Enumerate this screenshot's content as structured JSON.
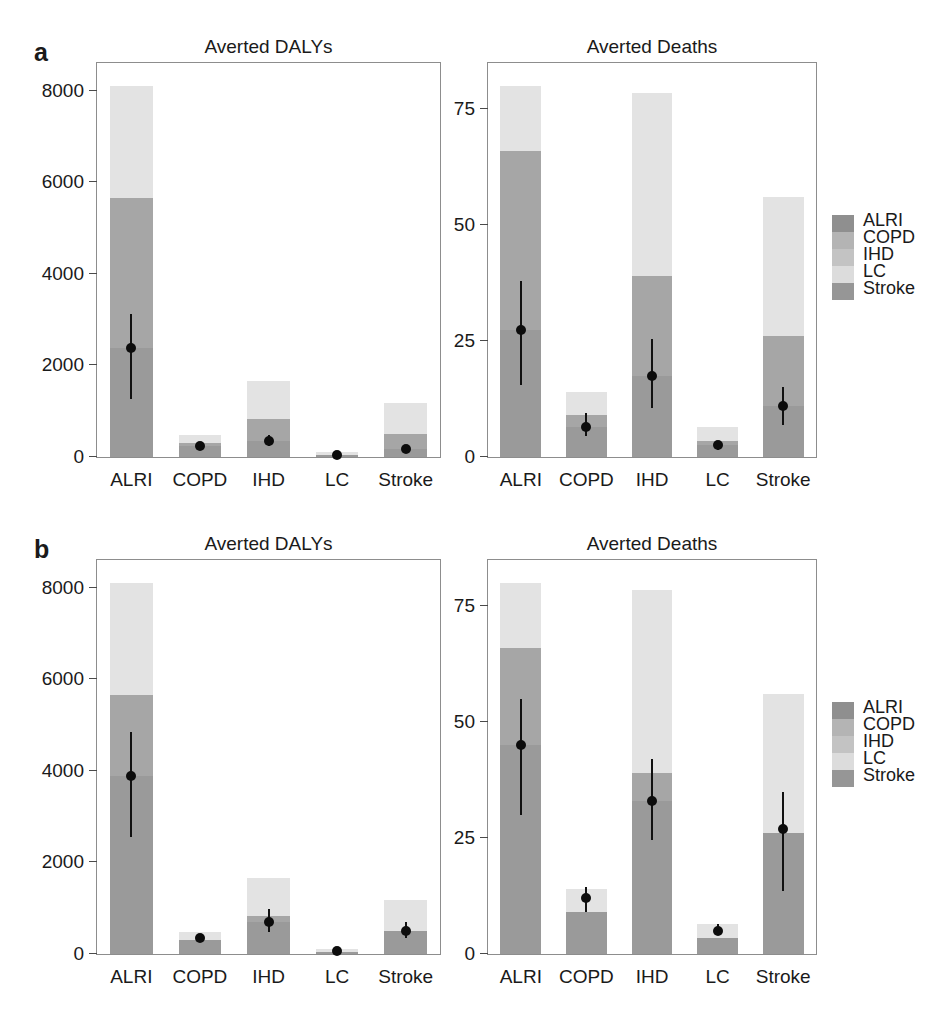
{
  "figure": {
    "panels": [
      {
        "letter": "a"
      },
      {
        "letter": "b"
      }
    ]
  },
  "legend": {
    "title": "",
    "items": [
      {
        "label": "ALRI",
        "color": "#8f8f8f"
      },
      {
        "label": "COPD",
        "color": "#b4b4b4"
      },
      {
        "label": "IHD",
        "color": "#c3c3c3"
      },
      {
        "label": "LC",
        "color": "#dcdcdc"
      },
      {
        "label": "Stroke",
        "color": "#969696"
      }
    ]
  },
  "chart_data": [
    {
      "type": "bar",
      "panel": "a",
      "title": "Averted DALYs",
      "xlabel": "",
      "ylabel": "",
      "ylim": [
        0,
        8600
      ],
      "yticks": [
        0,
        2000,
        4000,
        6000,
        8000
      ],
      "ytick_labels": [
        "0",
        "2000",
        "4000",
        "6000",
        "8000"
      ],
      "grid": false,
      "categories": [
        "ALRI",
        "COPD",
        "IHD",
        "LC",
        "Stroke"
      ],
      "series": [
        {
          "name": "lower segment",
          "values": [
            5650,
            300,
            820,
            50,
            500
          ]
        },
        {
          "name": "upper segment",
          "values": [
            2450,
            170,
            830,
            50,
            680
          ]
        }
      ],
      "bar_totals": [
        8100,
        470,
        1650,
        100,
        1180
      ],
      "points": [
        {
          "category": "ALRI",
          "value": 2380,
          "low": 1270,
          "high": 3130
        },
        {
          "category": "COPD",
          "value": 230,
          "low": 170,
          "high": 300
        },
        {
          "category": "IHD",
          "value": 350,
          "low": 230,
          "high": 470
        },
        {
          "category": "LC",
          "value": 35,
          "low": 20,
          "high": 50
        },
        {
          "category": "Stroke",
          "value": 170,
          "low": 90,
          "high": 260
        }
      ]
    },
    {
      "type": "bar",
      "panel": "a",
      "title": "Averted Deaths",
      "xlabel": "",
      "ylabel": "",
      "ylim": [
        0,
        85
      ],
      "yticks": [
        0,
        25,
        50,
        75
      ],
      "ytick_labels": [
        "0",
        "25",
        "50",
        "75"
      ],
      "grid": false,
      "categories": [
        "ALRI",
        "COPD",
        "IHD",
        "LC",
        "Stroke"
      ],
      "series": [
        {
          "name": "lower segment",
          "values": [
            66,
            9,
            39,
            3.5,
            26
          ]
        },
        {
          "name": "upper segment",
          "values": [
            14,
            5,
            39.5,
            3,
            30
          ]
        }
      ],
      "bar_totals": [
        80,
        14,
        78.5,
        6.5,
        56
      ],
      "points": [
        {
          "category": "ALRI",
          "value": 27.5,
          "low": 15.5,
          "high": 38
        },
        {
          "category": "COPD",
          "value": 6.5,
          "low": 4.5,
          "high": 9.5
        },
        {
          "category": "IHD",
          "value": 17.5,
          "low": 10.5,
          "high": 25.5
        },
        {
          "category": "LC",
          "value": 2.5,
          "low": 1.5,
          "high": 3.5
        },
        {
          "category": "Stroke",
          "value": 11,
          "low": 7,
          "high": 15
        }
      ]
    },
    {
      "type": "bar",
      "panel": "b",
      "title": "Averted DALYs",
      "xlabel": "",
      "ylabel": "",
      "ylim": [
        0,
        8600
      ],
      "yticks": [
        0,
        2000,
        4000,
        6000,
        8000
      ],
      "ytick_labels": [
        "0",
        "2000",
        "4000",
        "6000",
        "8000"
      ],
      "grid": false,
      "categories": [
        "ALRI",
        "COPD",
        "IHD",
        "LC",
        "Stroke"
      ],
      "series": [
        {
          "name": "lower segment",
          "values": [
            5650,
            300,
            820,
            50,
            500
          ]
        },
        {
          "name": "upper segment",
          "values": [
            2450,
            170,
            830,
            50,
            680
          ]
        }
      ],
      "bar_totals": [
        8100,
        470,
        1650,
        100,
        1180
      ],
      "points": [
        {
          "category": "ALRI",
          "value": 3880,
          "low": 2550,
          "high": 4850
        },
        {
          "category": "COPD",
          "value": 340,
          "low": 290,
          "high": 400
        },
        {
          "category": "IHD",
          "value": 700,
          "low": 490,
          "high": 980
        },
        {
          "category": "LC",
          "value": 75,
          "low": 55,
          "high": 95
        },
        {
          "category": "Stroke",
          "value": 500,
          "low": 340,
          "high": 700
        }
      ]
    },
    {
      "type": "bar",
      "panel": "b",
      "title": "Averted Deaths",
      "xlabel": "",
      "ylabel": "",
      "ylim": [
        0,
        85
      ],
      "yticks": [
        0,
        25,
        50,
        75
      ],
      "ytick_labels": [
        "0",
        "25",
        "50",
        "75"
      ],
      "grid": false,
      "categories": [
        "ALRI",
        "COPD",
        "IHD",
        "LC",
        "Stroke"
      ],
      "series": [
        {
          "name": "lower segment",
          "values": [
            66,
            9,
            39,
            3.5,
            26
          ]
        },
        {
          "name": "upper segment",
          "values": [
            14,
            5,
            39.5,
            3,
            30
          ]
        }
      ],
      "bar_totals": [
        80,
        14,
        78.5,
        6.5,
        56
      ],
      "points": [
        {
          "category": "ALRI",
          "value": 45,
          "low": 30,
          "high": 55
        },
        {
          "category": "COPD",
          "value": 12,
          "low": 9,
          "high": 14.5
        },
        {
          "category": "IHD",
          "value": 33,
          "low": 24.5,
          "high": 42
        },
        {
          "category": "LC",
          "value": 5,
          "low": 4,
          "high": 6.5
        },
        {
          "category": "Stroke",
          "value": 27,
          "low": 13.5,
          "high": 35
        }
      ]
    }
  ]
}
